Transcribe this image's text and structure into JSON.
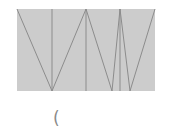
{
  "diagram": {
    "type": "folded-strip-zigzag",
    "colors": {
      "fill": "#cccccc",
      "stroke": "#8c8c8c",
      "background": "#ffffff"
    },
    "rect": {
      "x": 17,
      "y": 9,
      "w": 138,
      "h": 82
    },
    "vertical_lines": [
      52,
      86,
      120
    ],
    "zigzag_points": [
      [
        17,
        9
      ],
      [
        52,
        91
      ],
      [
        86,
        9
      ],
      [
        112,
        91
      ],
      [
        120,
        9
      ],
      [
        130,
        91
      ],
      [
        155,
        9
      ]
    ]
  },
  "caption": {
    "text": "("
  }
}
